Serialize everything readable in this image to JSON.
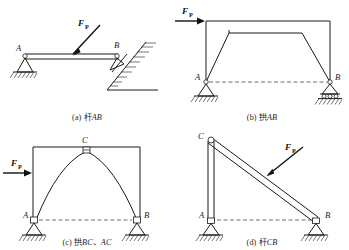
{
  "figure": {
    "panel_count": 4,
    "line_color": "#1a1a1a",
    "background": "#ffffff"
  },
  "panels": [
    {
      "id": "a",
      "caption_index": "(a)",
      "caption_cjk": "杆",
      "caption_member": "AB",
      "caption_full": "(a) 杆AB",
      "description": "Horizontal bar AB with pin support at A on hatched ground and inclined hatched surface support at B, loaded by inclined force F_P",
      "force": {
        "label": "F",
        "subscript": "P",
        "direction": "inclined-down-left",
        "applied_at": "midspan of bar AB"
      },
      "nodes": [
        {
          "label": "A",
          "support": "pin",
          "ground": "horizontal-hatched"
        },
        {
          "label": "B",
          "support": "inclined-surface",
          "ground": "inclined-hatched"
        }
      ],
      "member_type": "straight-bar"
    },
    {
      "id": "b",
      "caption_index": "(b)",
      "caption_cjk": "拱",
      "caption_member": "AB",
      "caption_full": "(b) 拱AB",
      "description": "Trapezoidal portal arch AB, pin support at A and roller support at B, horizontal force F_P applied at top-left corner",
      "force": {
        "label": "F",
        "subscript": "P",
        "direction": "horizontal-right",
        "applied_at": "top of left column"
      },
      "nodes": [
        {
          "label": "A",
          "support": "pin",
          "ground": "horizontal-hatched"
        },
        {
          "label": "B",
          "support": "roller",
          "ground": "horizontal-hatched"
        }
      ],
      "member_type": "trapezoidal-frame"
    },
    {
      "id": "c",
      "caption_index": "(c)",
      "caption_cjk": "拱",
      "caption_member": "BC、AC",
      "caption_full": "(c) 拱BC、AC",
      "description": "Three-hinged parabolic arch with crown hinge at C, pin supports at A and B, horizontal force F_P on left column",
      "force": {
        "label": "F",
        "subscript": "P",
        "direction": "horizontal-right",
        "applied_at": "left column"
      },
      "nodes": [
        {
          "label": "C",
          "support": "hinge",
          "position": "crown"
        },
        {
          "label": "A",
          "support": "pin",
          "ground": "horizontal-hatched"
        },
        {
          "label": "B",
          "support": "pin",
          "ground": "horizontal-hatched"
        }
      ],
      "member_type": "curved-arch-pair"
    },
    {
      "id": "d",
      "caption_index": "(d)",
      "caption_cjk": "杆",
      "caption_member": "CB",
      "caption_full": "(d) 杆CB",
      "description": "Vertical member AC and inclined member CB pinned at C, pin support at A and roller support at B, force F_P normal to member CB",
      "force": {
        "label": "F",
        "subscript": "P",
        "direction": "perpendicular-to-CB",
        "applied_at": "midpoint of member CB"
      },
      "nodes": [
        {
          "label": "C",
          "support": "pin-joint",
          "position": "top"
        },
        {
          "label": "A",
          "support": "pin",
          "ground": "horizontal-hatched"
        },
        {
          "label": "B",
          "support": "roller",
          "ground": "horizontal-hatched"
        }
      ],
      "member_type": "two-bar-assembly"
    }
  ]
}
